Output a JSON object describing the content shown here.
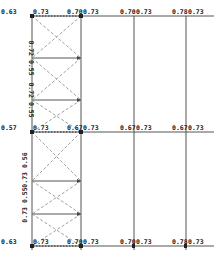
{
  "diagram": {
    "type": "structural frame utilization ratios",
    "columns_x": [
      32,
      81,
      134,
      186
    ],
    "levels_y": [
      16,
      132,
      246
    ],
    "top_labels": [
      {
        "x": 1,
        "y": 14,
        "text": "0.63"
      },
      {
        "x": 33,
        "y": 14,
        "text": "0.73"
      },
      {
        "x": 67,
        "y": 14,
        "text": "0.70"
      },
      {
        "x": 83,
        "y": 14,
        "text": "0.73"
      },
      {
        "x": 120,
        "y": 14,
        "text": "0.70"
      },
      {
        "x": 136,
        "y": 14,
        "text": "0.73"
      },
      {
        "x": 172,
        "y": 14,
        "text": "0.78"
      },
      {
        "x": 188,
        "y": 14,
        "text": "0.73"
      }
    ],
    "mid_labels": [
      {
        "x": 1,
        "y": 130,
        "text": "0.57"
      },
      {
        "x": 33,
        "y": 130,
        "text": "0.73"
      },
      {
        "x": 67,
        "y": 130,
        "text": "0.67"
      },
      {
        "x": 83,
        "y": 130,
        "text": "0.73"
      },
      {
        "x": 120,
        "y": 130,
        "text": "0.67"
      },
      {
        "x": 136,
        "y": 130,
        "text": "0.73"
      },
      {
        "x": 172,
        "y": 130,
        "text": "0.67"
      },
      {
        "x": 188,
        "y": 130,
        "text": "0.73"
      }
    ],
    "bottom_labels": [
      {
        "x": 1,
        "y": 244,
        "text": "0.63"
      },
      {
        "x": 33,
        "y": 244,
        "text": "0.73"
      },
      {
        "x": 67,
        "y": 244,
        "text": "0.70"
      },
      {
        "x": 83,
        "y": 244,
        "text": "0.73"
      },
      {
        "x": 120,
        "y": 244,
        "text": "0.70"
      },
      {
        "x": 136,
        "y": 244,
        "text": "0.73"
      },
      {
        "x": 172,
        "y": 244,
        "text": "0.78"
      },
      {
        "x": 188,
        "y": 244,
        "text": "0.73"
      }
    ],
    "vertical_labels": [
      {
        "x": 29,
        "y": 58,
        "text": "0.72 0.55",
        "rotate": 90
      },
      {
        "x": 29,
        "y": 100,
        "text": "0.72 0.55",
        "rotate": 90
      },
      {
        "x": 27,
        "y": 170,
        "text": "0.73 0.56",
        "rotate": -90
      },
      {
        "x": 27,
        "y": 205,
        "text": "0.73 0.55",
        "rotate": -90
      }
    ],
    "colors": {
      "frame": "#555555",
      "brace": "#888888",
      "text": "#222222"
    }
  }
}
